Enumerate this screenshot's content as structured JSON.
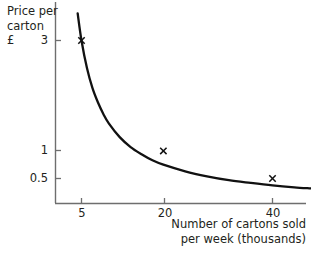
{
  "chart_data": {
    "type": "line",
    "title": "",
    "subtitle": "",
    "xlabel": "Number of cartons sold per week (thousands)",
    "ylabel": "Price per carton £",
    "ylabel_lines": [
      "Price per",
      "carton",
      "£"
    ],
    "xlabel_lines": [
      "Number of cartons sold",
      "per week (thousands)"
    ],
    "grid": false,
    "legend": "none",
    "xlim": [
      0,
      48
    ],
    "ylim": [
      0,
      3.6
    ],
    "xticks": [
      5,
      20,
      40
    ],
    "xtick_labels": [
      "5",
      "20",
      "40"
    ],
    "yticks": [
      0.5,
      1,
      3
    ],
    "ytick_labels": [
      "0.5",
      "1",
      "3"
    ],
    "relationship": "price = 15 / quantity",
    "series": [
      {
        "name": "Demand curve",
        "x": [
          4.3,
          5,
          6,
          7,
          8,
          9,
          10,
          12,
          14,
          16,
          18,
          20,
          24,
          28,
          32,
          36,
          40,
          44,
          47
        ],
        "y": [
          3.49,
          3.0,
          2.5,
          2.14,
          1.88,
          1.67,
          1.5,
          1.25,
          1.07,
          0.94,
          0.83,
          0.75,
          0.63,
          0.54,
          0.47,
          0.42,
          0.375,
          0.34,
          0.32
        ]
      }
    ],
    "markers": [
      {
        "label": "x",
        "x": 5,
        "y": 3
      },
      {
        "label": "x",
        "x": 20,
        "y": 1
      },
      {
        "label": "x",
        "x": 40,
        "y": 0.5
      }
    ],
    "colors": {
      "curve": "#111111",
      "axis": "#6e6e6e",
      "text": "#231f20",
      "background": "#ffffff"
    }
  }
}
